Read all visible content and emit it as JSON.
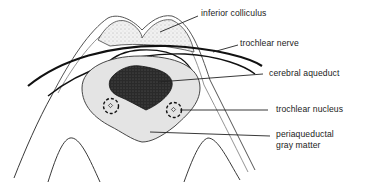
{
  "diagram": {
    "type": "anatomical cross-section",
    "labels": {
      "inferior_colliculus": "inferior colliculus",
      "trochlear_nerve": "trochlear nerve",
      "cerebral_aqueduct": "cerebral aqueduct",
      "trochlear_nucleus": "trochlear nucleus",
      "periaqueductal_line1": "periaqueductal",
      "periaqueductal_line2": "gray matter"
    },
    "colors": {
      "ink": "#1a1a1a",
      "stipple_fill": "#ececec",
      "gray_matter_fill": "#e2e2e2",
      "aqueduct_fill": "#2b2b2b"
    }
  }
}
